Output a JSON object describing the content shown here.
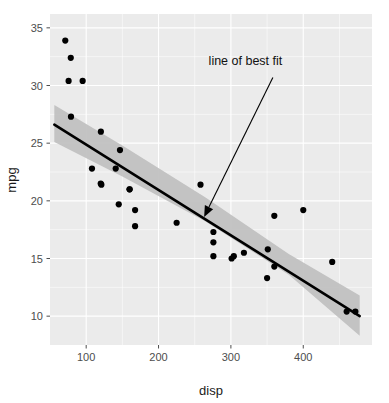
{
  "chart_data": {
    "type": "scatter",
    "title": "",
    "xlabel": "disp",
    "ylabel": "mpg",
    "xlim": [
      50,
      495
    ],
    "ylim": [
      7.5,
      36.2
    ],
    "xticks": [
      100,
      200,
      300,
      400
    ],
    "xtick_labels": [
      "100",
      "200",
      "300",
      "400"
    ],
    "yticks": [
      10,
      15,
      20,
      25,
      30,
      35
    ],
    "ytick_labels": [
      "10",
      "15",
      "20",
      "25",
      "30",
      "35"
    ],
    "grid": true,
    "grid_major": true,
    "grid_minor": true,
    "legend": "none",
    "point_color": "#000000",
    "point_size": 3.1,
    "panel_background": "#ebebeb",
    "grid_color": "#ffffff",
    "points": [
      {
        "x": 160.0,
        "y": 21.0
      },
      {
        "x": 160.0,
        "y": 21.0
      },
      {
        "x": 108.0,
        "y": 22.8
      },
      {
        "x": 258.0,
        "y": 21.4
      },
      {
        "x": 360.0,
        "y": 18.7
      },
      {
        "x": 225.0,
        "y": 18.1
      },
      {
        "x": 360.0,
        "y": 14.3
      },
      {
        "x": 146.7,
        "y": 24.4
      },
      {
        "x": 140.8,
        "y": 22.8
      },
      {
        "x": 167.6,
        "y": 19.2
      },
      {
        "x": 167.6,
        "y": 17.8
      },
      {
        "x": 275.8,
        "y": 16.4
      },
      {
        "x": 275.8,
        "y": 17.3
      },
      {
        "x": 275.8,
        "y": 15.2
      },
      {
        "x": 472.0,
        "y": 10.4
      },
      {
        "x": 460.0,
        "y": 10.4
      },
      {
        "x": 440.0,
        "y": 14.7
      },
      {
        "x": 78.7,
        "y": 32.4
      },
      {
        "x": 75.7,
        "y": 30.4
      },
      {
        "x": 71.1,
        "y": 33.9
      },
      {
        "x": 120.1,
        "y": 21.5
      },
      {
        "x": 318.0,
        "y": 15.5
      },
      {
        "x": 304.0,
        "y": 15.2
      },
      {
        "x": 350.0,
        "y": 13.3
      },
      {
        "x": 400.0,
        "y": 19.2
      },
      {
        "x": 79.0,
        "y": 27.3
      },
      {
        "x": 120.3,
        "y": 26.0
      },
      {
        "x": 95.1,
        "y": 30.4
      },
      {
        "x": 351.0,
        "y": 15.8
      },
      {
        "x": 145.0,
        "y": 19.7
      },
      {
        "x": 301.0,
        "y": 15.0
      },
      {
        "x": 121.0,
        "y": 21.4
      }
    ],
    "fit_line": {
      "label": "line of best fit",
      "type": "linear",
      "x_start": 56,
      "y_start": 26.6,
      "x_end": 478,
      "y_end": 10.0,
      "color": "#000000"
    },
    "confidence_band": {
      "color": "#bfbfbf",
      "upper": [
        {
          "x": 56,
          "y": 28.3
        },
        {
          "x": 150,
          "y": 24.8
        },
        {
          "x": 265,
          "y": 20.3
        },
        {
          "x": 380,
          "y": 15.4
        },
        {
          "x": 478,
          "y": 11.8
        }
      ],
      "lower": [
        {
          "x": 56,
          "y": 25.1
        },
        {
          "x": 150,
          "y": 22.1
        },
        {
          "x": 265,
          "y": 18.2
        },
        {
          "x": 380,
          "y": 13.6
        },
        {
          "x": 478,
          "y": 8.3
        }
      ]
    },
    "annotations": [
      {
        "text": "line of best fit",
        "text_x": 371,
        "text_y": 31.8,
        "arrow_from_x": 358,
        "arrow_from_y": 30.7,
        "arrow_to_x": 263,
        "arrow_to_y": 18.6
      }
    ]
  }
}
